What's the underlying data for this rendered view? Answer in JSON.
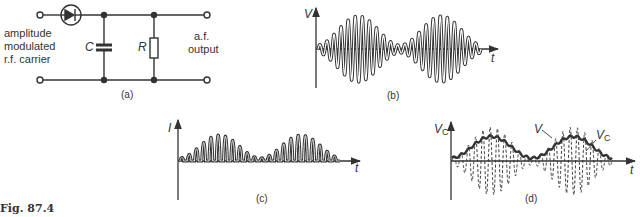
{
  "figure": {
    "caption": "Fig. 87.4",
    "circuit": {
      "label": "(a)",
      "input_label": [
        "amplitude",
        "modulated",
        "r.f. carrier"
      ],
      "output_label": [
        "a.f.",
        "output"
      ],
      "capacitor": "C",
      "resistor": "R",
      "components": [
        "diode",
        "capacitor C",
        "resistor R"
      ]
    },
    "panel_b": {
      "label": "(b)",
      "y_axis": "V",
      "x_axis": "t",
      "description": "amplitude modulated r.f. carrier"
    },
    "panel_c": {
      "label": "(c)",
      "y_axis": "I",
      "x_axis": "t",
      "description": "rectified current pulses"
    },
    "panel_d": {
      "label": "(d)",
      "y_axis": "V",
      "y_axis_sub": "C",
      "x_axis": "t",
      "curve_V": "V",
      "curve_Vc": "V",
      "curve_Vc_sub": "C",
      "description": "capacitor voltage follows envelope"
    }
  },
  "colors": {
    "ink": "#333333",
    "background": "#ffffff"
  }
}
